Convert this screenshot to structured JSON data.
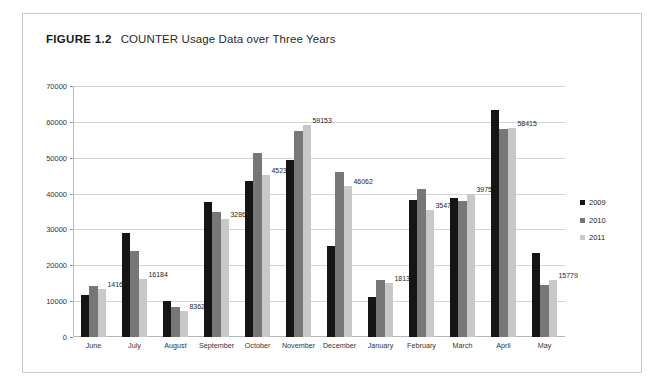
{
  "figure": {
    "number": "FIGURE 1.2",
    "title": "COUNTER Usage Data over Three Years"
  },
  "chart_data": {
    "type": "bar",
    "title": "COUNTER Usage Data over Three Years",
    "xlabel": "",
    "ylabel": "",
    "ylim": [
      0,
      70000
    ],
    "yticks": [
      0,
      10000,
      20000,
      30000,
      40000,
      50000,
      60000,
      70000
    ],
    "ytick_labels": [
      "0",
      "10000",
      "20000",
      "30000",
      "40000",
      "50000",
      "60000",
      "70000"
    ],
    "grid": true,
    "legend_position": "right",
    "categories": [
      "June",
      "July",
      "August",
      "September",
      "October",
      "November",
      "December",
      "January",
      "February",
      "March",
      "April",
      "May"
    ],
    "series": [
      {
        "name": "2009",
        "color": "#151515",
        "values": [
          11700,
          28900,
          10100,
          37700,
          43600,
          49300,
          25400,
          11100,
          38300,
          38800,
          63200,
          23500
        ]
      },
      {
        "name": "2010",
        "color": "#777777",
        "values": [
          14161,
          24100,
          8362,
          35000,
          51200,
          57500,
          46062,
          16000,
          41300,
          37800,
          57900,
          14600
        ]
      },
      {
        "name": "2011",
        "color": "#c8c8c8",
        "values": [
          13400,
          16184,
          7300,
          32869,
          45237,
          59153,
          42000,
          15000,
          35471,
          39750,
          58415,
          15779
        ]
      }
    ],
    "data_labels": [
      {
        "category": "June",
        "value": 14161,
        "text": "14161"
      },
      {
        "category": "July",
        "value": 16184,
        "text": "16184"
      },
      {
        "category": "August",
        "value": 8362,
        "text": "8362"
      },
      {
        "category": "September",
        "value": 32869,
        "text": "32869"
      },
      {
        "category": "October",
        "value": 45237,
        "text": "45237"
      },
      {
        "category": "November",
        "value": 59153,
        "text": "59153"
      },
      {
        "category": "December",
        "value": 46062,
        "text": "46062"
      },
      {
        "category": "January",
        "value": 18139,
        "text": "18139"
      },
      {
        "category": "February",
        "value": 35471,
        "text": "35471"
      },
      {
        "category": "March",
        "value": 39750,
        "text": "39750"
      },
      {
        "category": "April",
        "value": 58415,
        "text": "58415"
      },
      {
        "category": "May",
        "value": 15779,
        "text": "15779"
      }
    ]
  },
  "legend": {
    "items": [
      {
        "label": "2009",
        "color": "#151515"
      },
      {
        "label": "2010",
        "color": "#777777"
      },
      {
        "label": "2011",
        "color": "#c8c8c8"
      }
    ]
  }
}
